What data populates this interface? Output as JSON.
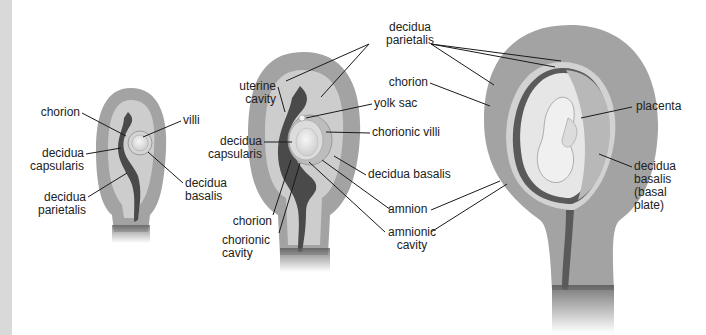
{
  "figure": {
    "stages": [
      {
        "id": "early",
        "labels": {
          "chorion": "chorion",
          "villi": "villi",
          "decidua_capsularis": [
            "decidua",
            "capsularis"
          ],
          "decidua_basalis": [
            "decidua",
            "basalis"
          ],
          "decidua_parietalis": [
            "decidua",
            "parietalis"
          ]
        }
      },
      {
        "id": "middle",
        "labels": {
          "uterine_cavity": [
            "uterine",
            "cavity"
          ],
          "decidua_parietalis": [
            "decidua",
            "parietalis"
          ],
          "yolk_sac": "yolk sac",
          "chorionic_villi": "chorionic villi",
          "decidua_capsularis": [
            "decidua",
            "capsularis"
          ],
          "decidua_basalis": "decidua basalis",
          "chorion": "chorion",
          "chorionic_cavity": [
            "chorionic",
            "cavity"
          ],
          "amnion": "amnion",
          "amnionic_cavity": [
            "amnionic",
            "cavity"
          ]
        }
      },
      {
        "id": "late",
        "labels": {
          "chorion": "chorion",
          "placenta": "placenta",
          "decidua_basalis": [
            "decidua",
            "basalis",
            "(basal",
            "plate)"
          ]
        }
      }
    ],
    "colors": {
      "myometrium": "#a3a3a3",
      "decidua": "#cdcdcd",
      "cavity": "#4a4a4a",
      "embryo": "#ececec",
      "leader": "#1a1a1a"
    }
  }
}
